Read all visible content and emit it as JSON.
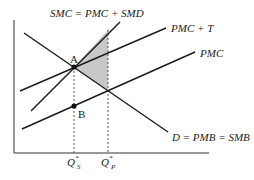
{
  "diagram": {
    "type": "economics-externality-tax",
    "curves": [
      {
        "id": "smc",
        "label": "SMC = PMC + SMD"
      },
      {
        "id": "pmc_t",
        "label": "PMC + T"
      },
      {
        "id": "pmc",
        "label": "PMC"
      },
      {
        "id": "demand",
        "label": "D = PMB = SMB"
      }
    ],
    "points": [
      {
        "id": "A",
        "label": "A"
      },
      {
        "id": "B",
        "label": "B"
      }
    ],
    "axis_ticks": [
      {
        "id": "qs",
        "main": "Q",
        "sup": "*",
        "sub": "S"
      },
      {
        "id": "qp",
        "main": "Q",
        "sup": "*",
        "sub": "P"
      }
    ],
    "shaded_region": "deadweight-loss triangle",
    "colors": {
      "shade": "#c8c8c8",
      "line": "#1a1a1a"
    }
  }
}
